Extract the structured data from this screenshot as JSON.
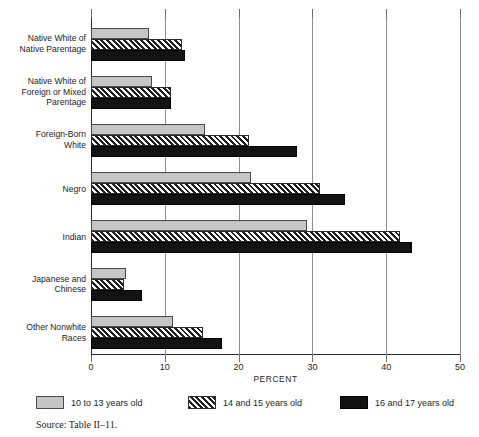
{
  "chart_data": {
    "type": "bar",
    "orientation": "horizontal",
    "title": "",
    "xlabel": "PERCENT",
    "ylabel": "",
    "xlim": [
      0,
      50
    ],
    "xticks": [
      0,
      10,
      20,
      30,
      40,
      50
    ],
    "xtick_labels": [
      "0",
      "10",
      "20",
      "30",
      "40",
      "50"
    ],
    "grid": true,
    "grid_axis": "x",
    "legend_position": "below",
    "categories": [
      "Native White of Native Parentage",
      "Native White of Foreign or Mixed Parentage",
      "Foreign-Born White",
      "Negro",
      "Indian",
      "Japanese and Chinese",
      "Other Nonwhite Races"
    ],
    "category_lines": [
      [
        "Native White of",
        "Native Parentage"
      ],
      [
        "Native White of",
        "Foreign or Mixed",
        "Parentage"
      ],
      [
        "Foreign-Born",
        "White"
      ],
      [
        "Negro"
      ],
      [
        "Indian"
      ],
      [
        "Japanese and",
        "Chinese"
      ],
      [
        "Other Nonwhite",
        "Races"
      ]
    ],
    "series": [
      {
        "name": "10 to 13 years old",
        "fill": "light-grey-solid",
        "color": "#c6c6c6",
        "values": [
          7.8,
          8.3,
          15.5,
          21.7,
          29.3,
          4.8,
          11.1
        ]
      },
      {
        "name": "14 and 15 years old",
        "fill": "black-diagonal-hatch",
        "color": "#d8d8d8",
        "values": [
          12.3,
          10.8,
          21.4,
          31.0,
          41.9,
          4.5,
          15.2
        ]
      },
      {
        "name": "16 and 17 years old",
        "fill": "black-solid",
        "color": "#121212",
        "values": [
          12.7,
          10.8,
          27.9,
          34.4,
          43.5,
          6.9,
          17.8
        ]
      }
    ]
  },
  "legend": {
    "items": [
      {
        "label": "10 to  13 years old"
      },
      {
        "label": "14  and 15 years old"
      },
      {
        "label": "16  and 17 years old"
      }
    ]
  },
  "source": {
    "text": "Source:  Table II–11."
  }
}
